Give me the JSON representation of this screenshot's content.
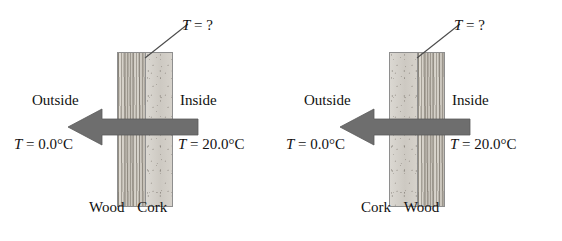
{
  "figure": {
    "panels": [
      {
        "id": "panel-left",
        "interface_label": "T = ?",
        "interface_symbol": "T",
        "interface_value": "= ?",
        "outside_label": "Outside",
        "inside_label": "Inside",
        "outside_temp_symbol": "T",
        "outside_temp_value": "= 0.0°C",
        "inside_temp_symbol": "T",
        "inside_temp_value": "= 20.0°C",
        "layer_left": "Wood",
        "layer_right": "Cork",
        "arrow_direction": "left",
        "arrow_meaning": "heat-flow-arrow"
      },
      {
        "id": "panel-right",
        "interface_label": "T = ?",
        "interface_symbol": "T",
        "interface_value": "= ?",
        "outside_label": "Outside",
        "inside_label": "Inside",
        "outside_temp_symbol": "T",
        "outside_temp_value": "= 0.0°C",
        "inside_temp_symbol": "T",
        "inside_temp_value": "= 20.0°C",
        "layer_left": "Cork",
        "layer_right": "Wood",
        "arrow_direction": "left",
        "arrow_meaning": "heat-flow-arrow"
      }
    ],
    "colors": {
      "arrow": "#6e6e6e",
      "arrow_outline": "#5a5a5a",
      "leader_line": "#4a4a4a",
      "slab_border": "#8e8e8e",
      "wood_fill": "#cfcbc4",
      "cork_fill": "#d4d1cb",
      "background": "#ffffff",
      "text": "#111111"
    }
  }
}
